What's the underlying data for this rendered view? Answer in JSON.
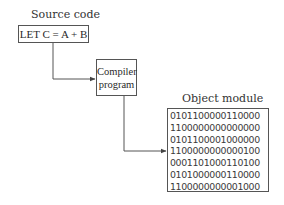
{
  "diagram": {
    "source": {
      "label": "Source code",
      "content": "LET C = A + B"
    },
    "compiler": {
      "lines": [
        "Compiler",
        "program"
      ]
    },
    "object": {
      "label": "Object module",
      "lines": [
        "0101100000110000",
        "1100000000000000",
        "0101100001000000",
        "1100000000000100",
        "0001101000110100",
        "0101000000110000",
        "1100000000001000"
      ]
    },
    "edges": [
      {
        "from": "source",
        "to": "compiler"
      },
      {
        "from": "compiler",
        "to": "object"
      }
    ],
    "colors": {
      "line": "#555555",
      "text": "#333333",
      "background": "#ffffff"
    }
  }
}
